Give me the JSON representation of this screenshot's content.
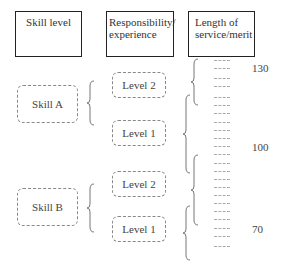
{
  "headers": [
    {
      "label": "Skill level"
    },
    {
      "label": "Responsibility/ experience",
      "line1": "Responsibility/",
      "line2": "experience"
    },
    {
      "label": "Length of service/merit",
      "line1": "Length of",
      "line2": "service/merit"
    }
  ],
  "skills": [
    {
      "label": "Skill A",
      "levels": [
        "Level 2",
        "Level 1"
      ]
    },
    {
      "label": "Skill B",
      "levels": [
        "Level 2",
        "Level 1"
      ]
    }
  ],
  "scale_labels": [
    "130",
    "100",
    "70"
  ],
  "colors": {
    "header_border": "#222222",
    "dashed_border": "#888888",
    "brace": "#777777"
  }
}
